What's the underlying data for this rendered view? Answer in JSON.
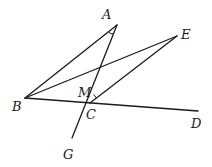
{
  "diagram": {
    "type": "geometry",
    "points": [
      {
        "id": "A",
        "label": "A",
        "x": 117,
        "y": 25,
        "label_x": 102,
        "label_y": 8
      },
      {
        "id": "B",
        "label": "B",
        "x": 25,
        "y": 98,
        "label_x": 12,
        "label_y": 100
      },
      {
        "id": "C",
        "label": "C",
        "x": 90,
        "y": 103,
        "label_x": 86,
        "label_y": 108
      },
      {
        "id": "D",
        "label": "D",
        "x": 198,
        "y": 111,
        "label_x": 191,
        "label_y": 117
      },
      {
        "id": "E",
        "label": "E",
        "x": 177,
        "y": 36,
        "label_x": 181,
        "label_y": 28
      },
      {
        "id": "G",
        "label": "G",
        "x": 72,
        "y": 138,
        "label_x": 63,
        "label_y": 148
      },
      {
        "id": "M",
        "label": "M",
        "x": 96,
        "y": 80,
        "label_x": 78,
        "label_y": 86
      }
    ],
    "segments": [
      {
        "from": "B",
        "to": "A"
      },
      {
        "from": "A",
        "to": "G"
      },
      {
        "from": "B",
        "to": "E"
      },
      {
        "from": "E",
        "to": "C"
      },
      {
        "from": "B",
        "to": "D"
      }
    ],
    "angle_marks": [
      {
        "vertex": "A",
        "between": [
          "B",
          "C"
        ]
      },
      {
        "vertex": "C",
        "between": [
          "E",
          "A"
        ]
      }
    ]
  }
}
